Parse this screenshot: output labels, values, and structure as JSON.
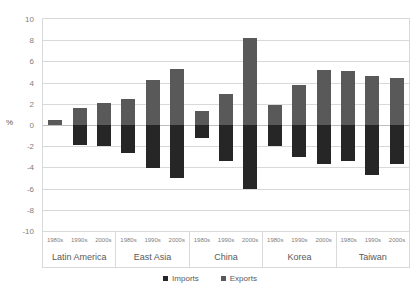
{
  "chart_data": {
    "type": "bar",
    "title": "",
    "subtitle": "",
    "xlabel": "",
    "ylabel": "%",
    "ylim": [
      -10,
      10
    ],
    "ytick_step": 2,
    "yticks": [
      "10",
      "8",
      "6",
      "4",
      "2",
      "0",
      "-2",
      "-4",
      "-6",
      "-8",
      "-10"
    ],
    "grid": true,
    "legend_position": "bottom-center",
    "orientation": "vertical",
    "stacked_around_zero": true,
    "group_labels": [
      "Latin America",
      "East Asia",
      "China",
      "Korea",
      "Taiwan"
    ],
    "categories": [
      "1980s",
      "1990s",
      "2000s"
    ],
    "series": [
      {
        "name": "Exports",
        "color": "#595959",
        "sign": "positive",
        "values_by_group": {
          "Latin America": [
            0.5,
            1.6,
            2.1
          ],
          "East Asia": [
            2.5,
            4.25,
            5.3
          ],
          "China": [
            1.3,
            2.9,
            8.2
          ],
          "Korea": [
            1.85,
            3.8,
            5.2
          ],
          "Taiwan": [
            5.1,
            4.6,
            4.4
          ]
        }
      },
      {
        "name": "Imports",
        "color": "#262626",
        "sign": "negative",
        "values_by_group": {
          "Latin America": [
            0.0,
            -1.85,
            -2.0
          ],
          "East Asia": [
            -2.6,
            -4.1,
            -5.0
          ],
          "China": [
            -1.2,
            -3.35,
            -6.0
          ],
          "Korea": [
            -2.0,
            -3.05,
            -3.7
          ],
          "Taiwan": [
            -3.4,
            -4.7,
            -3.65
          ]
        }
      }
    ]
  },
  "legend": {
    "items": [
      {
        "label": "Imports",
        "color": "#262626"
      },
      {
        "label": "Exports",
        "color": "#595959"
      }
    ]
  },
  "axis": {
    "y_title": "%"
  },
  "colors": {
    "exports": "#595959",
    "imports": "#262626",
    "grid": "#d9d9d9",
    "text": "#595959",
    "tick_text": "#808080",
    "background": "#ffffff"
  }
}
